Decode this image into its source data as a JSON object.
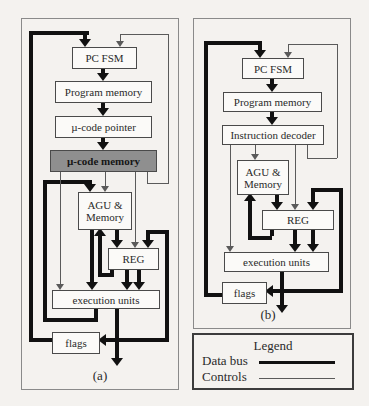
{
  "diagram_a": {
    "panel_label": "(a)",
    "nodes": {
      "pc_fsm": {
        "label": "PC FSM"
      },
      "program_memory": {
        "label": "Program memory"
      },
      "ucode_pointer": {
        "label": "µ-code pointer"
      },
      "ucode_memory": {
        "label": "µ-code memory"
      },
      "agu": {
        "label": "AGU & Memory"
      },
      "reg": {
        "label": "REG"
      },
      "execution_units": {
        "label": "execution units"
      },
      "flags": {
        "label": "flags"
      }
    }
  },
  "diagram_b": {
    "panel_label": "(b)",
    "nodes": {
      "pc_fsm": {
        "label": "PC FSM"
      },
      "program_memory": {
        "label": "Program memory"
      },
      "instruction_decoder": {
        "label": "Instruction decoder"
      },
      "agu": {
        "label": "AGU & Memory"
      },
      "reg": {
        "label": "REG"
      },
      "execution_units": {
        "label": "execution units"
      },
      "flags": {
        "label": "flags"
      }
    }
  },
  "legend": {
    "title": "Legend",
    "items": [
      {
        "label": "Data bus",
        "line_style": "thick"
      },
      {
        "label": "Controls",
        "line_style": "thin"
      }
    ]
  },
  "colors": {
    "data_bus": "#111111",
    "controls": "#5a5a5a",
    "ucode_memory_fill": "#8f8f8f",
    "background": "#f4f2ef"
  }
}
